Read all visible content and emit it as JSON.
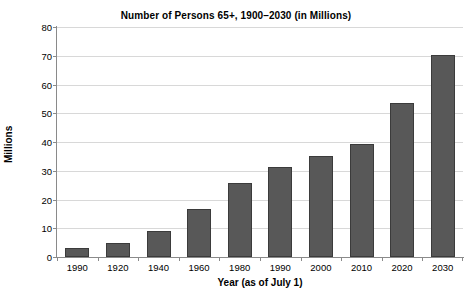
{
  "chart_data": {
    "type": "bar",
    "title": "Number of Persons 65+, 1900–2030 (in Millions)",
    "xlabel": "Year (as of July 1)",
    "ylabel": "Millions",
    "categories": [
      "1990",
      "1920",
      "1940",
      "1960",
      "1980",
      "1990",
      "2000",
      "2010",
      "2020",
      "2030"
    ],
    "values": [
      3.1,
      4.9,
      9.0,
      16.7,
      25.7,
      31.2,
      35.0,
      39.4,
      53.7,
      70.3
    ],
    "ylim": [
      0,
      80
    ],
    "yticks": [
      0,
      10,
      20,
      30,
      40,
      50,
      60,
      70,
      80
    ],
    "ytick_labels": [
      "0",
      "10",
      "20",
      "30",
      "40",
      "50",
      "60",
      "70",
      "80"
    ],
    "grid": true,
    "legend": "none",
    "bar_color": "#585858",
    "bar_edge_color": "#3b3b3b",
    "gridline_color": "#d8d8d8",
    "axis_color": "#8a8a8a",
    "background_color": "#ffffff"
  }
}
